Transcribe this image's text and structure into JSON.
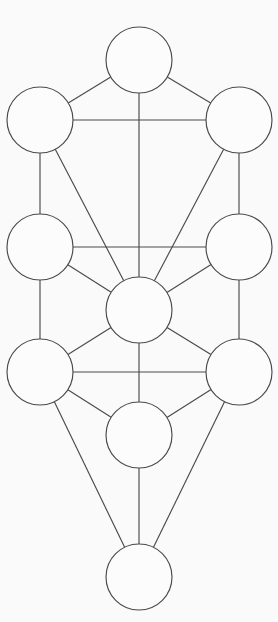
{
  "diagram": {
    "type": "node-link-graph",
    "background_color": "#fbfafa",
    "stroke_color": "#4a4a4a",
    "node_fill_color": "#fdfcfc",
    "stroke_width": 1.15,
    "canvas": {
      "width": 278,
      "height": 622
    },
    "node_radius": 33,
    "nodes": [
      {
        "id": "n1",
        "label": "",
        "cx": 139,
        "cy": 60,
        "r": 33,
        "name": "node-top-center"
      },
      {
        "id": "n2",
        "label": "",
        "cx": 239,
        "cy": 120,
        "r": 33,
        "name": "node-upper-right"
      },
      {
        "id": "n3",
        "label": "",
        "cx": 40,
        "cy": 120,
        "r": 33,
        "name": "node-upper-left"
      },
      {
        "id": "n4",
        "label": "",
        "cx": 239,
        "cy": 247,
        "r": 33,
        "name": "node-middle-right"
      },
      {
        "id": "n5",
        "label": "",
        "cx": 40,
        "cy": 247,
        "r": 33,
        "name": "node-middle-left"
      },
      {
        "id": "n6",
        "label": "",
        "cx": 139,
        "cy": 310,
        "r": 33,
        "name": "node-center"
      },
      {
        "id": "n7",
        "label": "",
        "cx": 239,
        "cy": 372,
        "r": 33,
        "name": "node-lower-right"
      },
      {
        "id": "n8",
        "label": "",
        "cx": 40,
        "cy": 372,
        "r": 33,
        "name": "node-lower-left"
      },
      {
        "id": "n9",
        "label": "",
        "cx": 139,
        "cy": 435,
        "r": 33,
        "name": "node-lower-center"
      },
      {
        "id": "n10",
        "label": "",
        "cx": 139,
        "cy": 577,
        "r": 33,
        "name": "node-bottom-center"
      }
    ],
    "edges": [
      {
        "from": "n1",
        "to": "n3",
        "name": "path-top-to-upper-left"
      },
      {
        "from": "n1",
        "to": "n2",
        "name": "path-top-to-upper-right"
      },
      {
        "from": "n1",
        "to": "n6",
        "name": "path-top-to-center"
      },
      {
        "from": "n3",
        "to": "n2",
        "name": "path-upper-left-to-upper-right"
      },
      {
        "from": "n3",
        "to": "n5",
        "name": "path-upper-left-to-middle-left"
      },
      {
        "from": "n3",
        "to": "n6",
        "name": "path-upper-left-to-center"
      },
      {
        "from": "n2",
        "to": "n4",
        "name": "path-upper-right-to-middle-right"
      },
      {
        "from": "n2",
        "to": "n6",
        "name": "path-upper-right-to-center"
      },
      {
        "from": "n5",
        "to": "n4",
        "name": "path-middle-left-to-middle-right"
      },
      {
        "from": "n5",
        "to": "n6",
        "name": "path-middle-left-to-center"
      },
      {
        "from": "n5",
        "to": "n8",
        "name": "path-middle-left-to-lower-left"
      },
      {
        "from": "n4",
        "to": "n6",
        "name": "path-middle-right-to-center"
      },
      {
        "from": "n4",
        "to": "n7",
        "name": "path-middle-right-to-lower-right"
      },
      {
        "from": "n6",
        "to": "n8",
        "name": "path-center-to-lower-left"
      },
      {
        "from": "n6",
        "to": "n7",
        "name": "path-center-to-lower-right"
      },
      {
        "from": "n6",
        "to": "n9",
        "name": "path-center-to-lower-center"
      },
      {
        "from": "n8",
        "to": "n7",
        "name": "path-lower-left-to-lower-right"
      },
      {
        "from": "n8",
        "to": "n9",
        "name": "path-lower-left-to-lower-center"
      },
      {
        "from": "n8",
        "to": "n10",
        "name": "path-lower-left-to-bottom"
      },
      {
        "from": "n7",
        "to": "n9",
        "name": "path-lower-right-to-lower-center"
      },
      {
        "from": "n7",
        "to": "n10",
        "name": "path-lower-right-to-bottom"
      },
      {
        "from": "n9",
        "to": "n10",
        "name": "path-lower-center-to-bottom"
      }
    ]
  }
}
